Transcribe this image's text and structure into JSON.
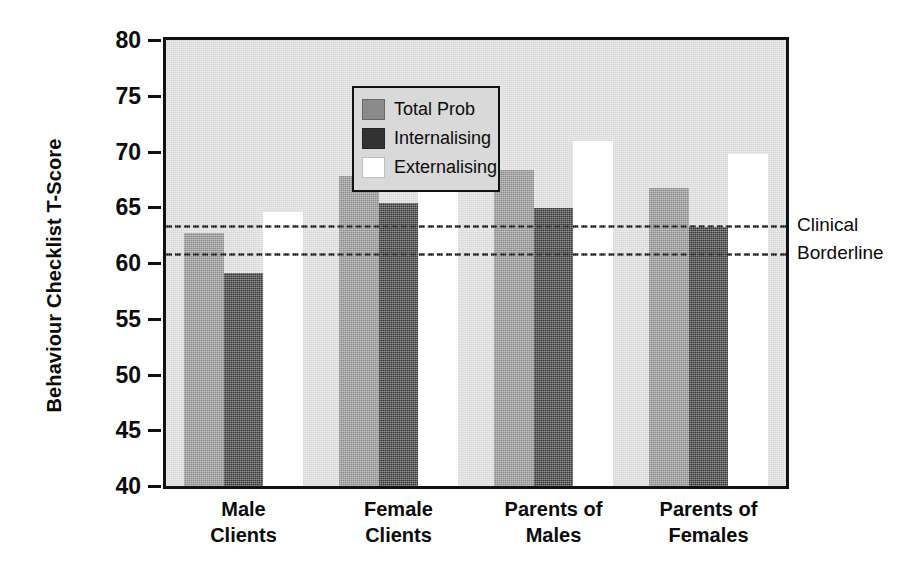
{
  "chart_data": {
    "type": "bar",
    "title": "",
    "xlabel": "",
    "ylabel": "Behaviour Checklist T-Score",
    "ylim": [
      40,
      80
    ],
    "ytick_step": 5,
    "yticks": [
      "80",
      "75",
      "70",
      "65",
      "60",
      "55",
      "50",
      "45",
      "40"
    ],
    "grid": false,
    "legend_position": "top-left",
    "categories": [
      {
        "line1": "Male",
        "line2": "Clients"
      },
      {
        "line1": "Female",
        "line2": "Clients"
      },
      {
        "line1": "Parents of",
        "line2": "Males"
      },
      {
        "line1": "Parents of",
        "line2": "Females"
      }
    ],
    "series": [
      {
        "name": "Total Prob",
        "color": "#8b8b8b",
        "values": [
          62.7,
          67.8,
          68.3,
          66.7
        ]
      },
      {
        "name": "Internalising",
        "color": "#323232",
        "values": [
          59.1,
          65.4,
          64.9,
          63.2
        ]
      },
      {
        "name": "Externalising",
        "color": "#ffffff",
        "values": [
          64.6,
          71.7,
          70.9,
          69.8
        ]
      }
    ],
    "reference_lines": [
      {
        "label": "Clinical",
        "value": 63.4
      },
      {
        "label": "Borderline",
        "value": 60.9
      }
    ]
  },
  "style": {
    "plot_background": "#d9d9d9",
    "axis_color": "#111111",
    "text_color": "#0b0b0b"
  }
}
